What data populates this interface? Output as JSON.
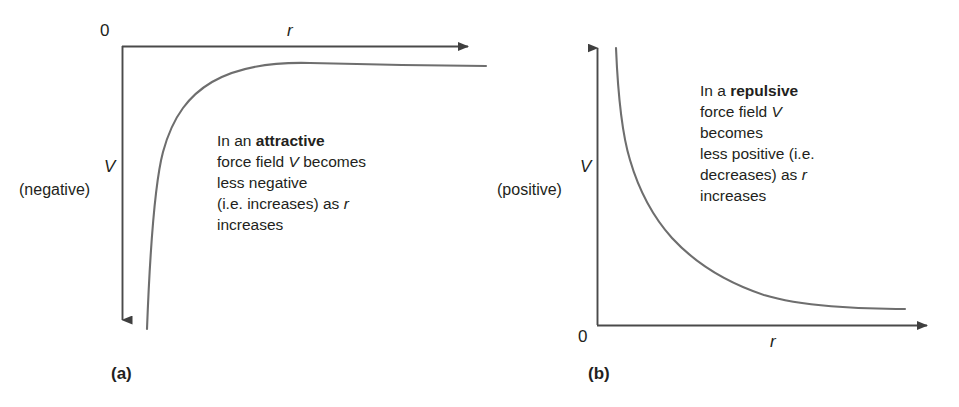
{
  "figure": {
    "curve_color": "#6e6e6e",
    "axis_color": "#4a4a4a",
    "text_color": "#231f20",
    "background": "#ffffff"
  },
  "panel_a": {
    "caption": "(a)",
    "origin_label": "0",
    "x_axis_label": "r",
    "y_axis_label": "V",
    "y_axis_sign": "(negative)",
    "annotation": {
      "lines": [
        [
          {
            "t": "In an ",
            "style": "normal"
          },
          {
            "t": "attractive",
            "style": "bold"
          }
        ],
        [
          {
            "t": "force field ",
            "style": "normal"
          },
          {
            "t": "V",
            "style": "italic"
          },
          {
            "t": " becomes",
            "style": "normal"
          }
        ],
        [
          {
            "t": "less negative",
            "style": "normal"
          }
        ],
        [
          {
            "t": "(i.e. increases) as ",
            "style": "normal"
          },
          {
            "t": "r",
            "style": "italic"
          }
        ],
        [
          {
            "t": "increases",
            "style": "normal"
          }
        ]
      ],
      "plain_text": "In an attractive force field V becomes less negative (i.e. increases) as r increases"
    }
  },
  "panel_b": {
    "caption": "(b)",
    "origin_label": "0",
    "x_axis_label": "r",
    "y_axis_label": "V",
    "y_axis_sign": "(positive)",
    "annotation": {
      "lines": [
        [
          {
            "t": "In a ",
            "style": "normal"
          },
          {
            "t": "repulsive",
            "style": "bold"
          }
        ],
        [
          {
            "t": "force field ",
            "style": "normal"
          },
          {
            "t": "V",
            "style": "italic"
          }
        ],
        [
          {
            "t": "becomes",
            "style": "normal"
          }
        ],
        [
          {
            "t": "less positive (i.e.",
            "style": "normal"
          }
        ],
        [
          {
            "t": "decreases) as ",
            "style": "normal"
          },
          {
            "t": "r",
            "style": "italic"
          }
        ],
        [
          {
            "t": "increases",
            "style": "normal"
          }
        ]
      ],
      "plain_text": "In a repulsive force field V becomes less positive (i.e. decreases) as r increases"
    }
  },
  "chart_data": [
    {
      "type": "line",
      "id": "panel-a-attractive",
      "title": "(a) Attractive force field",
      "xlabel": "r",
      "ylabel": "V (negative)",
      "grid": false,
      "legend": null,
      "function": "V = -k/r  (k > 0)",
      "xlim": [
        0,
        10
      ],
      "ylim": [
        -10,
        0
      ],
      "x": [
        0.72,
        0.8,
        0.9,
        1.0,
        1.2,
        1.4,
        1.6,
        2.0,
        2.5,
        3.0,
        3.5,
        4.0,
        5.0,
        6.0,
        7.0,
        8.0,
        9.0,
        10.0
      ],
      "y": [
        -9.7,
        -8.75,
        -7.78,
        -7.0,
        -5.83,
        -5.0,
        -4.38,
        -3.5,
        -2.8,
        -2.33,
        -2.0,
        -1.75,
        -1.4,
        -1.17,
        -1.0,
        -0.88,
        -0.78,
        -0.7
      ]
    },
    {
      "type": "line",
      "id": "panel-b-repulsive",
      "title": "(b) Repulsive force field",
      "xlabel": "r",
      "ylabel": "V (positive)",
      "grid": false,
      "legend": null,
      "function": "V = +k/r  (k > 0)",
      "xlim": [
        0,
        10
      ],
      "ylim": [
        0,
        10
      ],
      "x": [
        0.52,
        0.6,
        0.7,
        0.8,
        1.0,
        1.2,
        1.5,
        2.0,
        2.5,
        3.0,
        4.0,
        5.0,
        6.0,
        7.0,
        8.0,
        9.0,
        10.0
      ],
      "y": [
        9.6,
        8.33,
        7.14,
        6.25,
        5.0,
        4.17,
        3.33,
        2.5,
        2.0,
        1.67,
        1.25,
        1.0,
        0.83,
        0.71,
        0.63,
        0.56,
        0.5
      ]
    }
  ]
}
